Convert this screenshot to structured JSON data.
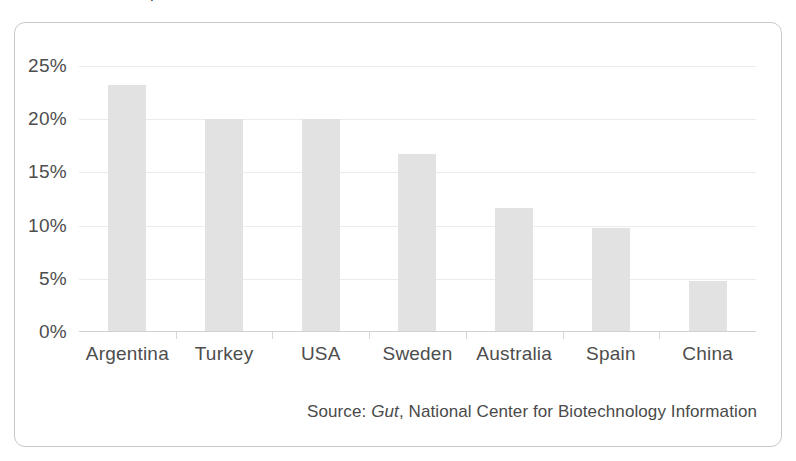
{
  "panel": {
    "title_fragment": "p"
  },
  "source": {
    "prefix": "Source: ",
    "emphasis": "Gut",
    "suffix": ", National Center for Biotechnology Information"
  },
  "colors": {
    "bar_fill": "#e2e2e2",
    "gridline": "#eceaea",
    "axis_line": "#d2d0d0",
    "panel_border": "#c9c9c9",
    "text": "#4d4d4d",
    "background": "#ffffff"
  },
  "chart_data": {
    "type": "bar",
    "title": "",
    "xlabel": "",
    "ylabel": "",
    "categories": [
      "Argentina",
      "Turkey",
      "USA",
      "Sweden",
      "Australia",
      "Spain",
      "China"
    ],
    "values": [
      23.2,
      20.0,
      20.0,
      16.7,
      11.7,
      9.8,
      4.8
    ],
    "value_labels": [
      "23.2%",
      "20.0%",
      "20.0%",
      "16.7%",
      "11.7%",
      "9.8%",
      "4.8%"
    ],
    "ylim": [
      0,
      25
    ],
    "ytick_values": [
      0,
      5,
      10,
      15,
      20,
      25
    ],
    "ytick_labels": [
      "0%",
      "5%",
      "10%",
      "15%",
      "20%",
      "25%"
    ],
    "grid": true,
    "legend": false,
    "legend_position": "none",
    "series": [
      {
        "name": "Prevalence",
        "values": [
          23.2,
          20.0,
          20.0,
          16.7,
          11.7,
          9.8,
          4.8
        ]
      }
    ]
  }
}
